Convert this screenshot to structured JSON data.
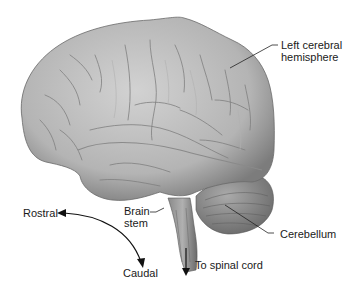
{
  "figure": {
    "colors": {
      "background": "#ffffff",
      "brain_light": "#c9c9c9",
      "brain_mid": "#a8a8a8",
      "brain_dark": "#6e6e6e",
      "text": "#1a1a1a",
      "leader_line": "#222222"
    }
  },
  "labels": {
    "left_cerebral_hemisphere_line1": "Left cerebral",
    "left_cerebral_hemisphere_line2": "hemisphere",
    "brain_stem_line1": "Brain",
    "brain_stem_line2": "stem",
    "cerebellum": "Cerebellum",
    "to_spinal_cord": "To spinal cord",
    "rostral": "Rostral",
    "caudal": "Caudal"
  }
}
